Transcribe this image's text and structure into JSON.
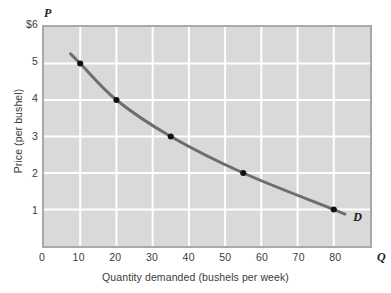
{
  "chart_data": {
    "type": "line",
    "title": "",
    "xlabel": "Quantity demanded (bushels per week)",
    "ylabel": "Price (per bushel)",
    "x_axis_symbol": "Q",
    "y_axis_symbol": "P",
    "xlim": [
      0,
      90
    ],
    "ylim": [
      0,
      6
    ],
    "xticks": [
      0,
      10,
      20,
      30,
      40,
      50,
      60,
      70,
      80
    ],
    "xtick_labels": [
      "0",
      "10",
      "20",
      "30",
      "40",
      "50",
      "60",
      "70",
      "80"
    ],
    "yticks": [
      1,
      2,
      3,
      4,
      5,
      6
    ],
    "ytick_labels": [
      "1",
      "2",
      "3",
      "4",
      "5",
      "$6"
    ],
    "grid": true,
    "grid_color": "#ffffff",
    "plot_background": "#d9d9d9",
    "legend": "none",
    "series": [
      {
        "name": "D",
        "label": "D",
        "label_position": "end-right",
        "color": "#6d6d6d",
        "marker_color": "#111111",
        "x": [
          10,
          20,
          35,
          55,
          80
        ],
        "y": [
          5,
          4,
          3,
          2,
          1
        ]
      }
    ],
    "annotations": [
      {
        "text": "D",
        "x": 86,
        "y": 0.82
      }
    ]
  },
  "figure": {
    "caption": ""
  }
}
